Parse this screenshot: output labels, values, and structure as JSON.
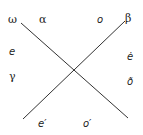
{
  "diagram": {
    "lines": [
      {
        "name": "descending-line",
        "x1": 21,
        "y1": 23,
        "x2": 128,
        "y2": 118
      },
      {
        "name": "ascending-line",
        "x1": 23,
        "y1": 119,
        "x2": 125,
        "y2": 21
      }
    ],
    "line_color": "#333333",
    "labels": {
      "top_left_outer": "ω",
      "top_left_inner": "α",
      "top_right_inner": "o",
      "top_right_outer": "β",
      "left_upper": "e",
      "left_lower": "γ",
      "right_upper": "ė",
      "right_lower": "ð",
      "bottom_left": "e′",
      "bottom_right": "o′"
    }
  }
}
